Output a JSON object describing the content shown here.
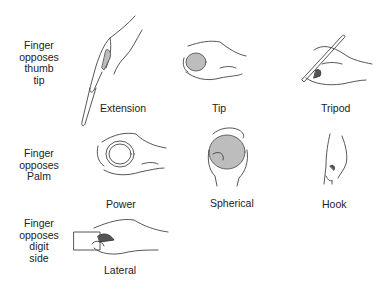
{
  "rows": [
    {
      "label": "Finger opposes thumb tip",
      "label_lines": [
        "Finger",
        "opposes",
        "thumb",
        "tip"
      ]
    },
    {
      "label": "Finger opposes Palm",
      "label_lines": [
        "Finger",
        "opposes",
        "Palm"
      ]
    },
    {
      "label": "Finger opposes digit side",
      "label_lines": [
        "Finger",
        "opposes",
        "digit",
        "side"
      ]
    }
  ],
  "grips": [
    {
      "name": "Extension",
      "icon": "extension-grip-hand-illustration"
    },
    {
      "name": "Tip",
      "icon": "tip-grip-hand-illustration"
    },
    {
      "name": "Tripod",
      "icon": "tripod-grip-hand-illustration"
    },
    {
      "name": "Power",
      "icon": "power-grip-hand-illustration"
    },
    {
      "name": "Spherical",
      "icon": "spherical-grip-hand-illustration"
    },
    {
      "name": "Hook",
      "icon": "hook-grip-hand-illustration"
    },
    {
      "name": "Lateral",
      "icon": "lateral-grip-hand-illustration"
    }
  ]
}
